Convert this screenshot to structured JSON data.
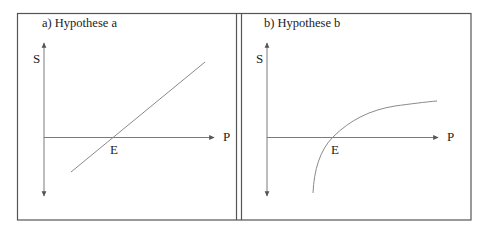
{
  "panels": [
    {
      "title": "a) Hypothese a",
      "y_axis_label": "S",
      "x_axis_label": "P",
      "point_label": "E",
      "curve_shape": "straight-line"
    },
    {
      "title": "b) Hypothese b",
      "y_axis_label": "S",
      "x_axis_label": "P",
      "point_label": "E",
      "curve_shape": "concave-logarithmic"
    }
  ],
  "colors": {
    "frame": "#555555",
    "axis": "#7a7a7a",
    "curve": "#8a8a8a",
    "text": "#222222"
  }
}
